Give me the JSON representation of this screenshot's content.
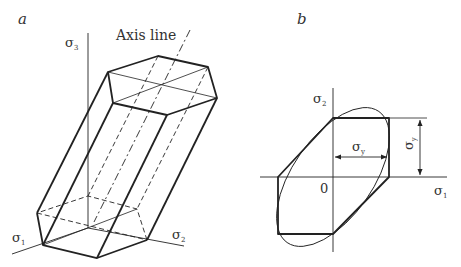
{
  "panel_a": {
    "label": "a",
    "axis_line_label": "Axis line",
    "axes": {
      "s3": {
        "symbol": "σ",
        "sub": "3"
      },
      "s1": {
        "symbol": "σ",
        "sub": "1"
      },
      "s2": {
        "symbol": "σ",
        "sub": "2"
      }
    },
    "shape": "hexagonal prism (Tresca yield surface)"
  },
  "panel_b": {
    "label": "b",
    "axes": {
      "s2": {
        "symbol": "σ",
        "sub": "2"
      },
      "s1": {
        "symbol": "σ",
        "sub": "1"
      }
    },
    "origin_label": "0",
    "dimension_h": {
      "symbol": "σ",
      "sub": "y"
    },
    "dimension_v": {
      "symbol": "σ",
      "sub": "y"
    },
    "shapes": [
      "Tresca hexagon",
      "von Mises ellipse"
    ]
  },
  "colors": {
    "line": "#222222",
    "text": "#333333"
  }
}
